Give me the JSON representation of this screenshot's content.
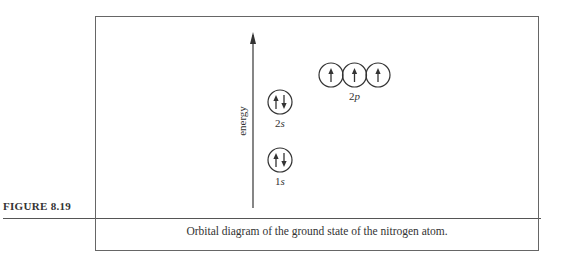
{
  "figure": {
    "number_label": "FIGURE 8.19",
    "caption": "Orbital diagram of the ground state of the nitrogen atom."
  },
  "diagram": {
    "axis_label": "energy",
    "axis_direction": "up",
    "subshells": [
      {
        "name": "1s",
        "number": "1",
        "letter": "s",
        "energy_rank": 0,
        "orbitals": [
          {
            "electrons": [
              "up",
              "down"
            ]
          }
        ]
      },
      {
        "name": "2s",
        "number": "2",
        "letter": "s",
        "energy_rank": 1,
        "orbitals": [
          {
            "electrons": [
              "up",
              "down"
            ]
          }
        ]
      },
      {
        "name": "2p",
        "number": "2",
        "letter": "p",
        "energy_rank": 2,
        "orbitals": [
          {
            "electrons": [
              "up"
            ]
          },
          {
            "electrons": [
              "up"
            ]
          },
          {
            "electrons": [
              "up"
            ]
          }
        ]
      }
    ],
    "colors": {
      "ink": "#333333",
      "frame": "#666666"
    }
  }
}
